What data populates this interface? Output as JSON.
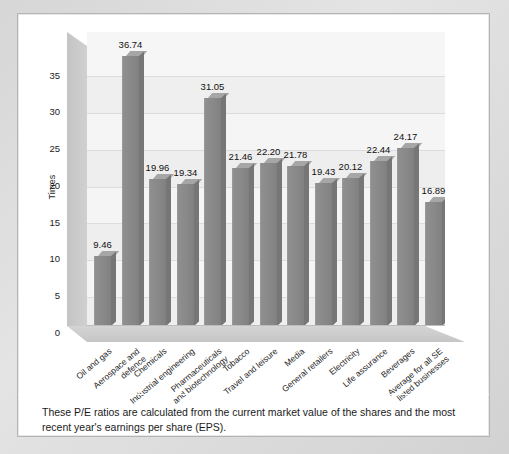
{
  "chart_data": {
    "type": "bar",
    "title": "",
    "xlabel": "",
    "ylabel": "Times",
    "ylim": [
      0,
      40
    ],
    "yticks": [
      0,
      5,
      10,
      15,
      20,
      25,
      30,
      35
    ],
    "grid": true,
    "legend": "none",
    "categories": [
      "Oil and gas",
      "Aerospace and\ndefence",
      "Chemicals",
      "Industrial engineering",
      "Pharmaceuticals\nand biotechnology",
      "Tobacco",
      "Travel and leisure",
      "Media",
      "General retailers",
      "Electricity",
      "Life assurance",
      "Beverages",
      "Average for all SE\nlisted businesses"
    ],
    "values": [
      9.46,
      36.74,
      19.96,
      19.34,
      31.05,
      21.46,
      22.2,
      21.78,
      19.43,
      20.12,
      22.44,
      24.17,
      16.89
    ],
    "value_labels": [
      "9.46",
      "36.74",
      "19.96",
      "19.34",
      "31.05",
      "21.46",
      "22.20",
      "21.78",
      "19.43",
      "20.12",
      "22.44",
      "24.17",
      "16.89"
    ],
    "bar_color": "#888888",
    "bar_top_color": "#a6a6a6",
    "bar_side_color": "#767676",
    "plot_background": "#f4f4f4",
    "gridline_color": "#dcdcdc"
  },
  "axis": {
    "y_title": "Times",
    "y_tick_labels": [
      "35",
      "30",
      "25",
      "20",
      "15",
      "10",
      "5",
      "0"
    ]
  },
  "caption": {
    "text": "These P/E ratios are calculated from the current market value of the shares and the most recent year's earnings per share (EPS)."
  }
}
